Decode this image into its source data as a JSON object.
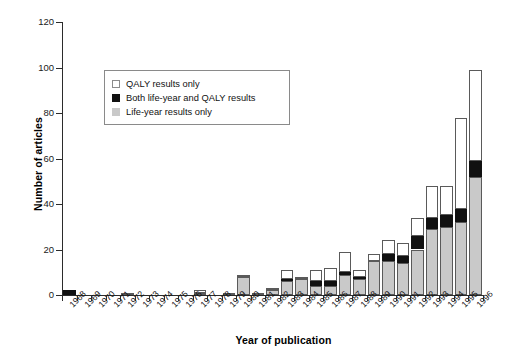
{
  "chart_data": {
    "type": "bar",
    "stacked": true,
    "title": "",
    "xlabel": "Year of publication",
    "ylabel": "Number of articles",
    "ylim": [
      0,
      120
    ],
    "yticks": [
      0,
      20,
      40,
      60,
      80,
      100,
      120
    ],
    "grid": false,
    "legend_position": "upper-left-inside",
    "categories": [
      "1968",
      "1969",
      "1970",
      "1971",
      "1972",
      "1973",
      "1974",
      "1975",
      "1976",
      "1977",
      "1978",
      "1979",
      "1980",
      "1981",
      "1982",
      "1983",
      "1984",
      "1985",
      "1986",
      "1987",
      "1988",
      "1989",
      "1990",
      "1991",
      "1992",
      "1993",
      "1994",
      "1995",
      "1996"
    ],
    "series": [
      {
        "name": "Life-year results only",
        "color": "#c9c9c9",
        "values": [
          0,
          0,
          0,
          0,
          0,
          0,
          0,
          0,
          0,
          1,
          0,
          1,
          8,
          1,
          2,
          6,
          7,
          4,
          4,
          9,
          7,
          15,
          15,
          14,
          20,
          29,
          30,
          32,
          52
        ]
      },
      {
        "name": "Both life-year and QALY results",
        "color": "#111111",
        "values": [
          2,
          0,
          0,
          0,
          0,
          0,
          0,
          0,
          0,
          0,
          0,
          0,
          0,
          0,
          0,
          1,
          0,
          2,
          2,
          1,
          1,
          0,
          3,
          3,
          6,
          5,
          5,
          6,
          7
        ]
      },
      {
        "name": "QALY results only",
        "color": "#ffffff",
        "values": [
          0,
          0,
          0,
          0,
          1,
          0,
          0,
          0,
          0,
          1,
          0,
          0,
          1,
          0,
          1,
          4,
          1,
          5,
          6,
          9,
          3,
          3,
          6,
          6,
          8,
          14,
          13,
          40,
          40
        ]
      }
    ],
    "totals": [
      2,
      0,
      0,
      0,
      1,
      0,
      0,
      0,
      0,
      2,
      0,
      1,
      9,
      1,
      3,
      11,
      8,
      11,
      12,
      19,
      11,
      18,
      24,
      23,
      34,
      48,
      48,
      78,
      99
    ]
  },
  "legend": {
    "items": [
      {
        "label": "QALY results only",
        "swatch": "qaly"
      },
      {
        "label": "Both life-year and QALY results",
        "swatch": "both"
      },
      {
        "label": "Life-year results only",
        "swatch": "lifeyr"
      }
    ]
  }
}
